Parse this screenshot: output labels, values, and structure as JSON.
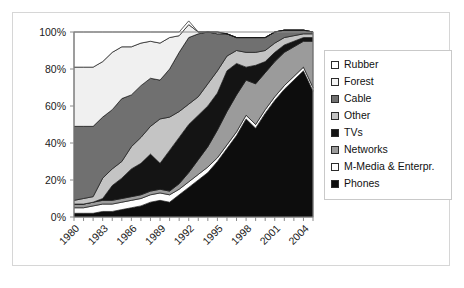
{
  "chart_data": {
    "type": "area",
    "stacked": true,
    "normalized": true,
    "title": "",
    "xlabel": "",
    "ylabel": "",
    "ylim": [
      0,
      100
    ],
    "ytick_labels": [
      "0%",
      "20%",
      "40%",
      "60%",
      "80%",
      "100%"
    ],
    "ytick_values": [
      0,
      20,
      40,
      60,
      80,
      100
    ],
    "grid": false,
    "legend_position": "right",
    "x": [
      1980,
      1981,
      1982,
      1983,
      1984,
      1985,
      1986,
      1987,
      1988,
      1989,
      1990,
      1991,
      1992,
      1993,
      1994,
      1995,
      1996,
      1997,
      1998,
      1999,
      2000,
      2001,
      2002,
      2003,
      2004,
      2005
    ],
    "xtick_labels": [
      "1980",
      "1983",
      "1986",
      "1989",
      "1992",
      "1995",
      "1998",
      "2001",
      "2004"
    ],
    "xtick_values": [
      1980,
      1983,
      1986,
      1989,
      1992,
      1995,
      1998,
      2001,
      2004
    ],
    "series": [
      {
        "name": "Phones",
        "color": "#0d0d0d",
        "values": [
          2,
          2,
          2,
          3,
          3,
          4,
          5,
          6,
          8,
          9,
          8,
          12,
          16,
          20,
          24,
          30,
          37,
          44,
          53,
          48,
          56,
          63,
          69,
          74,
          79,
          68
        ]
      },
      {
        "name": "M-Media & Enterpr.",
        "color": "#fdfdfd",
        "values": [
          3,
          3,
          4,
          4,
          4,
          4,
          4,
          4,
          4,
          4,
          4,
          3,
          3,
          3,
          3,
          2,
          2,
          2,
          2,
          2,
          2,
          2,
          2,
          2,
          2,
          2
        ]
      },
      {
        "name": "Networks",
        "color": "#9b9b9b",
        "values": [
          2,
          2,
          2,
          2,
          2,
          2,
          2,
          2,
          2,
          2,
          2,
          3,
          5,
          8,
          11,
          15,
          18,
          20,
          19,
          22,
          20,
          19,
          18,
          16,
          14,
          25
        ]
      },
      {
        "name": "TVs",
        "color": "#141414",
        "values": [
          0,
          0,
          0,
          1,
          8,
          11,
          15,
          17,
          20,
          14,
          22,
          25,
          26,
          24,
          22,
          20,
          22,
          17,
          7,
          10,
          6,
          5,
          4,
          3,
          2,
          2
        ]
      },
      {
        "name": "Other",
        "color": "#c4c4c4",
        "values": [
          2,
          3,
          3,
          11,
          9,
          9,
          12,
          14,
          15,
          24,
          18,
          14,
          11,
          10,
          12,
          12,
          8,
          7,
          8,
          7,
          6,
          5,
          4,
          3,
          2,
          2
        ]
      },
      {
        "name": "Cable",
        "color": "#707070",
        "values": [
          40,
          39,
          38,
          33,
          32,
          34,
          28,
          28,
          26,
          21,
          26,
          32,
          36,
          34,
          28,
          20,
          12,
          7,
          8,
          8,
          7,
          6,
          4,
          3,
          2,
          1
        ]
      },
      {
        "name": "Forest",
        "color": "#f0f0f0",
        "values": [
          32,
          32,
          32,
          30,
          31,
          28,
          26,
          23,
          20,
          20,
          17,
          9,
          7,
          1,
          0,
          1,
          0,
          0,
          0,
          0,
          0,
          0,
          0,
          0,
          0,
          0
        ]
      },
      {
        "name": "Rubber",
        "color": "#ffffff",
        "values": [
          19,
          19,
          19,
          16,
          11,
          8,
          8,
          6,
          5,
          6,
          3,
          2,
          2,
          0,
          0,
          0,
          0,
          0,
          0,
          0,
          0,
          0,
          0,
          0,
          0,
          0
        ]
      }
    ]
  },
  "legend": {
    "items": [
      {
        "label": "Rubber",
        "swatch": "#ffffff"
      },
      {
        "label": "Forest",
        "swatch": "#f4f4f4"
      },
      {
        "label": "Cable",
        "swatch": "#707070"
      },
      {
        "label": "Other",
        "swatch": "#c4c4c4"
      },
      {
        "label": "TVs",
        "swatch": "#141414"
      },
      {
        "label": "Networks",
        "swatch": "#9b9b9b"
      },
      {
        "label": "M-Media & Enterpr.",
        "swatch": "#fdfdfd"
      },
      {
        "label": "Phones",
        "swatch": "#0d0d0d"
      }
    ]
  }
}
